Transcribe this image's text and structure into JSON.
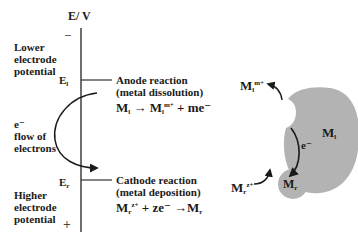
{
  "axis": {
    "title": "E/ V",
    "minus_sign": "−",
    "plus_sign": "+",
    "top_label": [
      "Lower",
      "electrode",
      "potential"
    ],
    "bottom_label": [
      "Higher",
      "electrode",
      "potential"
    ],
    "e1_label": "E",
    "e1_sub": "l",
    "er_label": "E",
    "er_sub": "r"
  },
  "electron_flow": {
    "symbol": "e⁻",
    "line1": "flow of",
    "line2": "electrons"
  },
  "anode": {
    "title": "Anode reaction",
    "subtitle": "(metal dissolution)",
    "eq_m": "M",
    "eq_m_sub": "l",
    "eq_arrow": " → ",
    "eq_prod": "M",
    "eq_prod_sub": "l",
    "eq_prod_sup": "m+",
    "eq_rest": " + me⁻"
  },
  "cathode": {
    "title": "Cathode reaction",
    "subtitle": "(metal deposition)",
    "eq_m": "M",
    "eq_m_sub": "r",
    "eq_m_sup": "z+",
    "eq_mid": " + ze⁻ ",
    "eq_arrow": "→",
    "eq_prod": "M",
    "eq_prod_sub": "r"
  },
  "galvanic_cell": {
    "large_metal": "M",
    "large_metal_sub": "l",
    "small_metal": "M",
    "small_metal_sub": "r",
    "electron": "e⁻",
    "ion_out": "M",
    "ion_out_sub": "l",
    "ion_out_sup": "m+",
    "ion_in": "M",
    "ion_in_sub": "r",
    "ion_in_sup": "z+",
    "fill_color": "#b3b3b3"
  }
}
